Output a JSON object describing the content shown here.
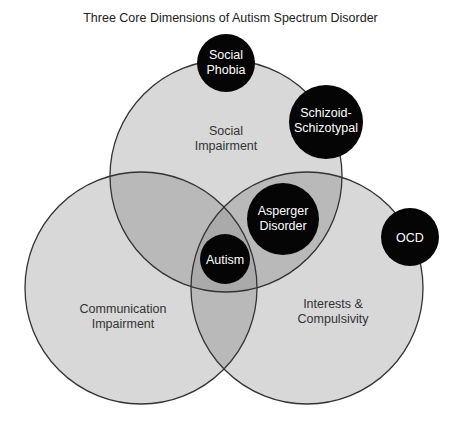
{
  "title": "Three Core Dimensions of Autism Spectrum Disorder",
  "colors": {
    "single": "#d8d8d8",
    "double": "#b9b9b9",
    "triple": "#aaaaaa",
    "stroke": "#333333",
    "disorder": "#050505",
    "disorder_text": "#ffffff"
  },
  "dimensions": [
    {
      "id": "social",
      "line1": "Social",
      "line2": "Impairment"
    },
    {
      "id": "communication",
      "line1": "Communication",
      "line2": "Impairment"
    },
    {
      "id": "interests",
      "line1": "Interests &",
      "line2": "Compulsivity"
    }
  ],
  "disorders": [
    {
      "id": "social-phobia",
      "line1": "Social",
      "line2": "Phobia"
    },
    {
      "id": "schizoid",
      "line1": "Schizoid-",
      "line2": "Schizotypal"
    },
    {
      "id": "asperger",
      "line1": "Asperger",
      "line2": "Disorder"
    },
    {
      "id": "autism",
      "line1": "Autism"
    },
    {
      "id": "ocd",
      "line1": "OCD"
    }
  ]
}
